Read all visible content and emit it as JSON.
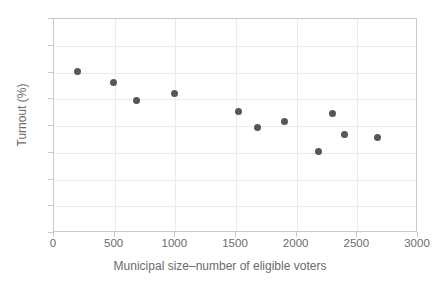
{
  "chart_data": {
    "type": "scatter",
    "title": "",
    "xlabel": "Municipal size–number of eligible voters",
    "ylabel": "Turnout (%)",
    "xlim": [
      0,
      3000
    ],
    "ylim": [
      60,
      100
    ],
    "xticks": [
      0,
      500,
      1000,
      1500,
      2000,
      2500,
      3000
    ],
    "xtick_labels": [
      "0",
      "500",
      "1000",
      "1500",
      "2000",
      "2500",
      "3000"
    ],
    "yticks": [
      60,
      65,
      70,
      75,
      80,
      85,
      90,
      95,
      100
    ],
    "ytick_labels": [
      "60",
      "65",
      "70",
      "75",
      "80",
      "85",
      "90",
      "95",
      "100"
    ],
    "grid": true,
    "legend": null,
    "marker_color": "#555759",
    "marker_size": 7,
    "points": [
      {
        "x": 195,
        "y": 90.2
      },
      {
        "x": 490,
        "y": 88.2
      },
      {
        "x": 680,
        "y": 84.7
      },
      {
        "x": 990,
        "y": 86.0
      },
      {
        "x": 1520,
        "y": 82.8
      },
      {
        "x": 1675,
        "y": 79.7
      },
      {
        "x": 1900,
        "y": 80.9
      },
      {
        "x": 2180,
        "y": 75.3
      },
      {
        "x": 2295,
        "y": 82.4
      },
      {
        "x": 2395,
        "y": 78.5
      },
      {
        "x": 2665,
        "y": 77.8
      }
    ],
    "series": [
      {
        "name": "turnout",
        "x": [
          195,
          490,
          680,
          990,
          1520,
          1675,
          1900,
          2180,
          2295,
          2395,
          2665
        ],
        "values": [
          90.2,
          88.2,
          84.7,
          86.0,
          82.8,
          79.7,
          80.9,
          75.3,
          82.4,
          78.5,
          77.8
        ]
      }
    ]
  },
  "colors": {
    "marker": "#555759",
    "grid": "#ebebeb",
    "frame": "#c9c9c9",
    "text": "#6b6b6b",
    "background": "#ffffff"
  }
}
